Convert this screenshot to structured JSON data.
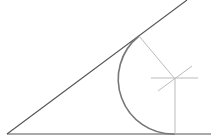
{
  "diagram": {
    "colors": {
      "background": "#ffffff",
      "line": "#555555",
      "arc": "#777777",
      "construction": "#bbbbbb"
    },
    "vertex": [
      7,
      134
    ],
    "line_upper": {
      "from": [
        7,
        134
      ],
      "to": [
        187,
        0
      ]
    },
    "line_lower": {
      "from": [
        7,
        134
      ],
      "to": [
        211,
        134
      ]
    },
    "center": [
      175,
      79
    ],
    "tangent_point_upper": [
      139,
      36
    ],
    "tangent_point_lower": [
      175,
      134
    ],
    "radius": 55
  }
}
